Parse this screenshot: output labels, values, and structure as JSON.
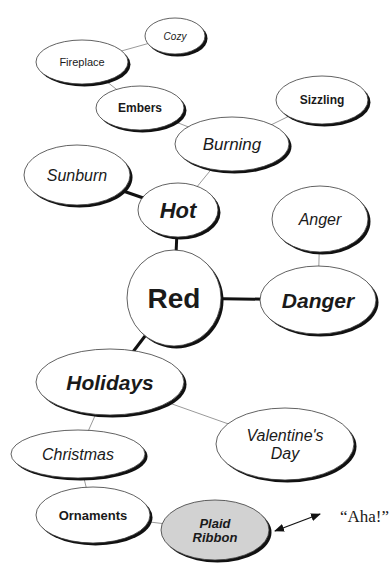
{
  "diagram": {
    "type": "concept-map",
    "central_node": "Red",
    "nodes": [
      {
        "id": "cozy",
        "label": "Cozy",
        "cx": 175,
        "cy": 36,
        "rx": 30,
        "ry": 18,
        "style": "italic",
        "weight": "normal",
        "size": 10
      },
      {
        "id": "fireplace",
        "label": "Fireplace",
        "cx": 82,
        "cy": 62,
        "rx": 46,
        "ry": 22,
        "style": "normal",
        "weight": "normal",
        "size": 11
      },
      {
        "id": "embers",
        "label": "Embers",
        "cx": 140,
        "cy": 108,
        "rx": 44,
        "ry": 22,
        "style": "normal",
        "weight": "bold",
        "size": 12
      },
      {
        "id": "sizzling",
        "label": "Sizzling",
        "cx": 322,
        "cy": 100,
        "rx": 46,
        "ry": 24,
        "style": "normal",
        "weight": "bold",
        "size": 12
      },
      {
        "id": "burning",
        "label": "Burning",
        "cx": 232,
        "cy": 144,
        "rx": 57,
        "ry": 27,
        "style": "italic",
        "weight": "normal",
        "size": 17
      },
      {
        "id": "sunburn",
        "label": "Sunburn",
        "cx": 77,
        "cy": 175,
        "rx": 53,
        "ry": 30,
        "style": "italic",
        "weight": "normal",
        "size": 16
      },
      {
        "id": "hot",
        "label": "Hot",
        "cx": 178,
        "cy": 210,
        "rx": 40,
        "ry": 27,
        "style": "italic",
        "weight": "bold",
        "size": 22
      },
      {
        "id": "anger",
        "label": "Anger",
        "cx": 320,
        "cy": 219,
        "rx": 48,
        "ry": 33,
        "style": "italic",
        "weight": "normal",
        "size": 16
      },
      {
        "id": "red",
        "label": "Red",
        "cx": 174,
        "cy": 298,
        "rx": 47,
        "ry": 48,
        "style": "normal",
        "weight": "bold",
        "size": 28
      },
      {
        "id": "danger",
        "label": "Danger",
        "cx": 318,
        "cy": 300,
        "rx": 58,
        "ry": 34,
        "style": "italic",
        "weight": "bold",
        "size": 21
      },
      {
        "id": "holidays",
        "label": "Holidays",
        "cx": 110,
        "cy": 382,
        "rx": 74,
        "ry": 33,
        "style": "italic",
        "weight": "bold",
        "size": 21
      },
      {
        "id": "valentines",
        "label": "Valentine's Day",
        "lines": [
          "Valentine's",
          "Day"
        ],
        "cx": 285,
        "cy": 444,
        "rx": 69,
        "ry": 36,
        "style": "italic",
        "weight": "normal",
        "size": 16
      },
      {
        "id": "christmas",
        "label": "Christmas",
        "cx": 78,
        "cy": 454,
        "rx": 67,
        "ry": 24,
        "style": "italic",
        "weight": "normal",
        "size": 16
      },
      {
        "id": "ornaments",
        "label": "Ornaments",
        "cx": 93,
        "cy": 515,
        "rx": 57,
        "ry": 28,
        "style": "normal",
        "weight": "bold",
        "size": 13
      },
      {
        "id": "plaid",
        "label": "Plaid Ribbon",
        "lines": [
          "Plaid",
          "Ribbon"
        ],
        "cx": 215,
        "cy": 530,
        "rx": 54,
        "ry": 30,
        "style": "italic",
        "weight": "bold",
        "size": 13,
        "fill": "#d2d2d2"
      }
    ],
    "edges": [
      {
        "from": "cozy",
        "to": "fireplace",
        "weight": "thin"
      },
      {
        "from": "fireplace",
        "to": "embers",
        "weight": "thin"
      },
      {
        "from": "embers",
        "to": "burning",
        "weight": "thin"
      },
      {
        "from": "sizzling",
        "to": "burning",
        "weight": "thin"
      },
      {
        "from": "burning",
        "to": "hot",
        "weight": "thin"
      },
      {
        "from": "sunburn",
        "to": "hot",
        "weight": "thick"
      },
      {
        "from": "hot",
        "to": "red",
        "weight": "thick"
      },
      {
        "from": "anger",
        "to": "danger",
        "weight": "thin"
      },
      {
        "from": "red",
        "to": "danger",
        "weight": "thick"
      },
      {
        "from": "red",
        "to": "holidays",
        "weight": "thick"
      },
      {
        "from": "holidays",
        "to": "valentines",
        "weight": "thin"
      },
      {
        "from": "holidays",
        "to": "christmas",
        "weight": "thin"
      },
      {
        "from": "christmas",
        "to": "ornaments",
        "weight": "thin"
      },
      {
        "from": "ornaments",
        "to": "plaid",
        "weight": "thin"
      }
    ],
    "annotation": {
      "text": "“Aha!”",
      "x": 340,
      "y": 516,
      "arrow": {
        "x1": 275,
        "y1": 531,
        "x2": 320,
        "y2": 514,
        "double_headed": true
      }
    },
    "colors": {
      "background": "#ffffff",
      "ellipse_fill": "#ffffff",
      "ellipse_stroke": "#3a3a3a",
      "shadow": "#111111",
      "text": "#1a1a1a",
      "highlight_fill": "#d2d2d2",
      "thin_edge": "#9a9a9a",
      "thick_edge": "#111111"
    }
  }
}
